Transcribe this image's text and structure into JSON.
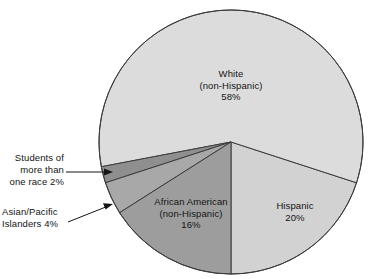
{
  "figure": {
    "background_color": "#ffffff",
    "title": ""
  },
  "chart_data": {
    "type": "pie",
    "title": "",
    "xlabel": "",
    "ylabel": "",
    "units": "percent",
    "total": 100,
    "legend": "none",
    "grid": false,
    "center": {
      "x": 231,
      "y": 142
    },
    "radius": 132,
    "start_angle_deg": 90,
    "direction": "counterclockwise",
    "categories": [
      "African American (non-Hispanic)",
      "Asian/Pacific Islanders",
      "Students of more than one race",
      "White (non-Hispanic)",
      "Hispanic"
    ],
    "values": [
      16,
      4,
      2,
      58,
      20
    ],
    "slices": [
      {
        "id": "african-american",
        "name": "African American (non-Hispanic)",
        "value": 16,
        "value_text": "16%",
        "label_lines": [
          "African American",
          "(non-Hispanic)",
          "16%"
        ],
        "color": "#9d9d9d",
        "label_placement": "inside"
      },
      {
        "id": "asian-pacific",
        "name": "Asian/Pacific Islanders",
        "value": 4,
        "value_text": "4%",
        "label_lines": [
          "Asian/Pacific",
          "Islanders 4%"
        ],
        "color": "#a8a8a8",
        "label_placement": "outside-left",
        "leader": "diagonal-arrow"
      },
      {
        "id": "more-than-one-race",
        "name": "Students of more than one race",
        "value": 2,
        "value_text": "2%",
        "label_lines": [
          "Students of",
          "more than",
          "one race 2%"
        ],
        "color": "#8f8f8f",
        "label_placement": "outside-left",
        "leader": "horizontal-arrow"
      },
      {
        "id": "white",
        "name": "White (non-Hispanic)",
        "value": 58,
        "value_text": "58%",
        "label_lines": [
          "White",
          "(non-Hispanic)",
          "58%"
        ],
        "color": "#dcdcdc",
        "label_placement": "inside"
      },
      {
        "id": "hispanic",
        "name": "Hispanic",
        "value": 20,
        "value_text": "20%",
        "label_lines": [
          "Hispanic",
          "20%"
        ],
        "color": "#d2d2d2",
        "label_placement": "inside"
      }
    ],
    "stroke_color": "#3c3c3c",
    "text_color": "#141414"
  },
  "labels": {
    "white": {
      "line1": "White",
      "line2": "(non-Hispanic)",
      "line3": "58%"
    },
    "african_american": {
      "line1": "African American",
      "line2": "(non-Hispanic)",
      "line3": "16%"
    },
    "hispanic": {
      "line1": "Hispanic",
      "line2": "20%"
    },
    "more_than_one_race": {
      "line1": "Students of",
      "line2": "more than",
      "line3": "one race 2%"
    },
    "asian_pacific": {
      "line1": "Asian/Pacific",
      "line2": "Islanders 4%"
    }
  }
}
